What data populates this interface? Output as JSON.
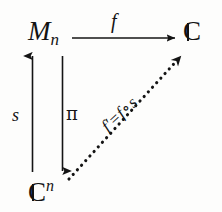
{
  "diagram": {
    "type": "commutative-diagram",
    "background_color": "#fdfdfc",
    "ink_color": "#141414",
    "nodes": [
      {
        "id": "node-mn",
        "position": "top-left",
        "base": "M",
        "subscript": "n",
        "full_text": "M_n"
      },
      {
        "id": "node-c-top",
        "position": "top-right",
        "base": "C",
        "style": "blackboard-bold",
        "full_text": "C"
      },
      {
        "id": "node-cn",
        "position": "bottom-left",
        "base": "C",
        "style": "blackboard-bold",
        "superscript": "n",
        "full_text": "C^n"
      }
    ],
    "arrows": [
      {
        "id": "arrow-f",
        "from": "node-mn",
        "to": "node-c-top",
        "label": "f",
        "line_style": "solid",
        "direction": "right"
      },
      {
        "id": "arrow-s",
        "from": "node-cn",
        "to": "node-mn",
        "label": "s",
        "line_style": "solid",
        "direction": "up"
      },
      {
        "id": "arrow-pi",
        "from": "node-mn",
        "to": "node-cn",
        "label": "π",
        "line_style": "solid",
        "direction": "down"
      },
      {
        "id": "arrow-fprime",
        "from": "node-cn",
        "to": "node-c-top",
        "label_lhs": "f′",
        "label_eq": "=",
        "label_rhs_left": "f",
        "label_op": "∘",
        "label_rhs_right": "s",
        "label_full": "f′ = f ∘ s",
        "line_style": "dotted",
        "direction": "up-right"
      }
    ]
  }
}
